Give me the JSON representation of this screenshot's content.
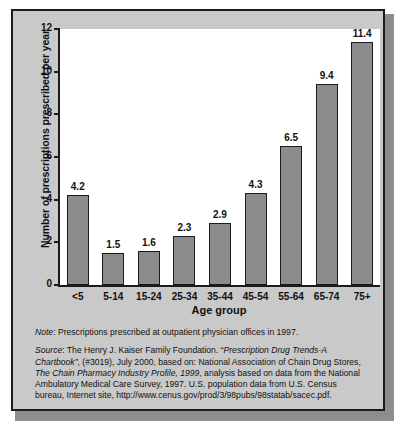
{
  "chart_data": {
    "type": "bar",
    "title": "",
    "xlabel": "Age group",
    "ylabel": "Number of prescriptions prescribed per year",
    "categories": [
      "<5",
      "5-14",
      "15-24",
      "25-34",
      "35-44",
      "45-54",
      "55-64",
      "65-74",
      "75+"
    ],
    "values": [
      4.2,
      1.5,
      1.6,
      2.3,
      2.9,
      4.3,
      6.5,
      9.4,
      11.4
    ],
    "value_labels": [
      "4.2",
      "1.5",
      "1.6",
      "2.3",
      "2.9",
      "4.3",
      "6.5",
      "9.4",
      "11.4"
    ],
    "ylim": [
      0,
      12
    ],
    "yticks": [
      0,
      2,
      4,
      6,
      8,
      10,
      12
    ],
    "ytick_labels": [
      "0",
      "2",
      "4",
      "6",
      "8",
      "10",
      "12"
    ],
    "grid": false,
    "legend": null,
    "bar_color": "#8c8c8c",
    "bar_edge_color": "#1b1b1b",
    "plot_background": "#ffffff",
    "panel_background": "#c9c9c9",
    "frame_color": "#1b1b1b"
  },
  "footnotes": {
    "note_label": "Note",
    "note_text": ": Prescriptions prescribed at outpatient physician offices in 1997.",
    "source_label": "Source",
    "source_part1": ": The Henry J. Kaiser Family Foundation. “",
    "source_italic1": "Prescription Drug Trends-A Chartbook”",
    "source_part2": ", (#3019), July 2000, based on: National Association of Chain Drug Stores, ",
    "source_italic2": "The Chain Pharmacy Industry Profile, 1999",
    "source_part3": ", analysis based on data from the National Ambulatory Medical Care Survey, 1997. U.S. population data from U.S. Census bureau, Internet site, http://www.cenus.gov/prod/3/98pubs/98statab/sacec.pdf."
  }
}
